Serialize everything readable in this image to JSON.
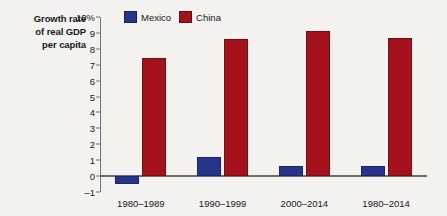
{
  "chart_data": {
    "type": "bar",
    "title": "",
    "ylabel": "Growth rate of real GDP per capita",
    "ylabel_lines": [
      "Growth rate",
      "of real GDP",
      "per capita"
    ],
    "xlabel": "",
    "categories": [
      "1980–1989",
      "1990–1999",
      "2000–2014",
      "1980–2014"
    ],
    "series": [
      {
        "name": "Mexico",
        "color": "#27348b",
        "values": [
          -0.5,
          1.2,
          0.65,
          0.65
        ]
      },
      {
        "name": "China",
        "color": "#a4111a",
        "values": [
          7.4,
          8.6,
          9.1,
          8.7
        ]
      }
    ],
    "ylim": [
      -1,
      10
    ],
    "yticks": [
      10,
      9,
      8,
      7,
      6,
      5,
      4,
      3,
      2,
      1,
      0,
      -1
    ],
    "ytick_labels": [
      "10%",
      "9",
      "8",
      "7",
      "6",
      "5",
      "4",
      "3",
      "2",
      "1",
      "0",
      "–1"
    ],
    "grid": false,
    "legend_position": "top-center",
    "legend": [
      {
        "label": "Mexico",
        "color": "#27348b"
      },
      {
        "label": "China",
        "color": "#a4111a"
      }
    ],
    "axis_color": "#75737a",
    "background": "#f3f2ef"
  }
}
